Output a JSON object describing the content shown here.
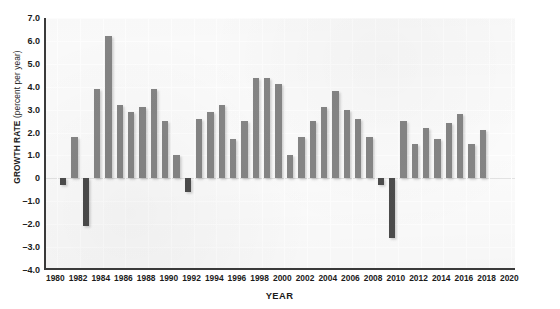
{
  "chart_data": {
    "type": "bar",
    "title": "",
    "xlabel": "YEAR",
    "ylabel": "GROWTH RATE",
    "ylabel_unit": "(percent per year)",
    "ylim": [
      -4.0,
      7.0
    ],
    "ytick_step": 1.0,
    "yticks": [
      "7.0",
      "6.0",
      "5.0",
      "4.0",
      "3.0",
      "2.0",
      "1.0",
      "0",
      "–1.0",
      "–2.0",
      "–3.0",
      "–4.0"
    ],
    "ytick_values": [
      7.0,
      6.0,
      5.0,
      4.0,
      3.0,
      2.0,
      1.0,
      0.0,
      -1.0,
      -2.0,
      -3.0,
      -4.0
    ],
    "xlim": [
      1979,
      2020.5
    ],
    "xticks": [
      "1980",
      "1982",
      "1984",
      "1986",
      "1988",
      "1990",
      "1992",
      "1994",
      "1996",
      "1998",
      "2000",
      "2002",
      "2004",
      "2006",
      "2008",
      "2010",
      "2012",
      "2014",
      "2016",
      "2018",
      "2020"
    ],
    "xtick_values": [
      1980,
      1982,
      1984,
      1986,
      1988,
      1990,
      1992,
      1994,
      1996,
      1998,
      2000,
      2002,
      2004,
      2006,
      2008,
      2010,
      2012,
      2014,
      2016,
      2018,
      2020
    ],
    "grid": true,
    "legend": "none",
    "colors": {
      "positive_bar": "#858585",
      "negative_bar": "#4c4c4c",
      "axis": "#3a3a3a",
      "plot_background": "#fbfbfb",
      "gridline": "#ffffff"
    },
    "categories": [
      1980,
      1981,
      1982,
      1983,
      1984,
      1985,
      1986,
      1987,
      1988,
      1989,
      1990,
      1991,
      1992,
      1993,
      1994,
      1995,
      1996,
      1997,
      1998,
      1999,
      2000,
      2001,
      2002,
      2003,
      2004,
      2005,
      2006,
      2007,
      2008,
      2009,
      2010,
      2011,
      2012,
      2013,
      2014,
      2015,
      2016,
      2017
    ],
    "values": [
      -0.3,
      1.8,
      -2.1,
      3.9,
      6.2,
      3.2,
      2.9,
      3.1,
      3.9,
      2.5,
      1.0,
      -0.6,
      2.6,
      2.9,
      3.2,
      1.7,
      2.5,
      4.4,
      4.4,
      4.1,
      1.0,
      1.8,
      2.5,
      3.1,
      3.8,
      3.0,
      2.6,
      1.8,
      -0.3,
      -2.6,
      2.5,
      1.5,
      2.2,
      1.7,
      2.4,
      2.8,
      1.5,
      2.1
    ]
  }
}
